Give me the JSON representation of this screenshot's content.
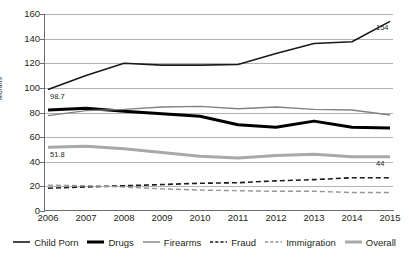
{
  "chart_data": {
    "type": "line",
    "title": "",
    "xlabel": "",
    "ylabel": "Months",
    "ylim": [
      0,
      160
    ],
    "ytick_step": 20,
    "grid": true,
    "legend_position": "bottom",
    "categories": [
      "2006",
      "2007",
      "2008",
      "2009",
      "2010",
      "2011",
      "2012",
      "2013",
      "2014",
      "2015"
    ],
    "yticks": [
      "160",
      "140",
      "120",
      "100",
      "80",
      "60",
      "40",
      "20",
      "0"
    ],
    "series": [
      {
        "name": "Child Porn",
        "style": "solid",
        "color": "#1a1a1a",
        "width": 1.6,
        "values": [
          98.7,
          110,
          120,
          118.5,
          118.5,
          119,
          128,
          136,
          137.5,
          154
        ]
      },
      {
        "name": "Drugs",
        "style": "solid",
        "color": "#000000",
        "width": 3.0,
        "values": [
          82,
          83.5,
          81,
          79,
          77,
          70,
          68,
          73,
          68,
          67.5
        ]
      },
      {
        "name": "Firearms",
        "style": "solid",
        "color": "#808285",
        "width": 1.4,
        "values": [
          77.5,
          81.5,
          82.5,
          84.5,
          85,
          83,
          84.5,
          82.5,
          82,
          78
        ]
      },
      {
        "name": "Fraud",
        "style": "dashed",
        "color": "#1a1a1a",
        "width": 1.6,
        "values": [
          18.5,
          19.5,
          20.5,
          21.5,
          22.5,
          23,
          24.5,
          25.5,
          27,
          27
        ]
      },
      {
        "name": "Immigration",
        "style": "dashed",
        "color": "#939598",
        "width": 1.4,
        "values": [
          21,
          20.5,
          19.5,
          18,
          17,
          16.5,
          16,
          16,
          15,
          15
        ]
      },
      {
        "name": "Overall",
        "style": "solid",
        "color": "#a7a9ac",
        "width": 3.0,
        "values": [
          51.8,
          52.5,
          50.5,
          47.5,
          44.5,
          43,
          45,
          46,
          44,
          44
        ]
      }
    ],
    "point_labels": [
      {
        "series": "Child Porn",
        "index": 0,
        "text": "98.7"
      },
      {
        "series": "Child Porn",
        "index": 9,
        "text": "154"
      },
      {
        "series": "Overall",
        "index": 0,
        "text": "51.8"
      },
      {
        "series": "Overall",
        "index": 9,
        "text": "44"
      }
    ],
    "colors": {
      "grid": "#b3b3b3",
      "axis": "#6d6e71",
      "text": "#231f20",
      "background": "#ffffff"
    }
  }
}
